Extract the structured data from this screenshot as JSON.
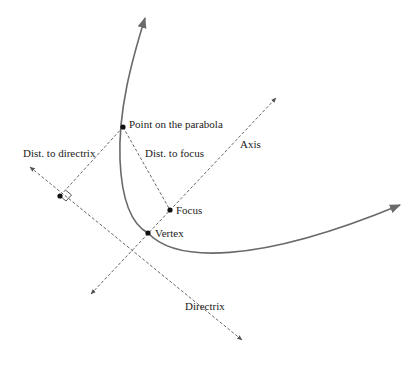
{
  "diagram": {
    "type": "parabola-definition",
    "colors": {
      "curve": "#6a6a6a",
      "dashed": "#555555",
      "point": "#111111",
      "text": "#222222"
    },
    "labels": {
      "point_on_parabola": "Point on the parabola",
      "dist_to_directrix": "Dist. to directrix",
      "dist_to_focus": "Dist. to focus",
      "axis": "Axis",
      "focus": "Focus",
      "vertex": "Vertex",
      "directrix": "Directrix"
    }
  }
}
